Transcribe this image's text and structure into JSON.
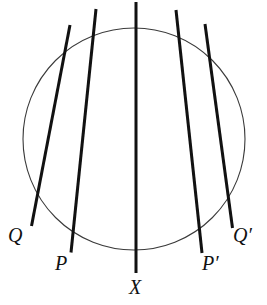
{
  "figure": {
    "kind": "geometry-diagram",
    "background_color": "#ffffff",
    "circle": {
      "name": "circle-outline",
      "center_x": 134,
      "center_y": 139,
      "radius": 111,
      "stroke_color": "#3a3a3a",
      "stroke_width": 1.1,
      "fill": "none"
    },
    "concurrency_point": {
      "name": "concurrency-point",
      "x": 135.5,
      "y": 105.5,
      "visible_marker": false
    },
    "line_style": {
      "stroke_color": "#111111",
      "stroke_width": 3.0,
      "linecap": "butt"
    },
    "lines": [
      {
        "id": "line-q",
        "label": "Q",
        "x1": 70.0,
        "y1": 25.0,
        "x2": 31.5,
        "y2": 226.0
      },
      {
        "id": "line-p",
        "label": "P",
        "x1": 96.0,
        "y1": 9.0,
        "x2": 71.0,
        "y2": 252.5
      },
      {
        "id": "line-x-vertical",
        "label": "X",
        "x1": 136.0,
        "y1": 2.0,
        "x2": 136.0,
        "y2": 273.0
      },
      {
        "id": "line-p-prime",
        "label": "P′",
        "x1": 176.0,
        "y1": 10.0,
        "x2": 202.0,
        "y2": 253.0
      },
      {
        "id": "line-q-prime",
        "label": "Q′",
        "x1": 205.0,
        "y1": 24.0,
        "x2": 232.5,
        "y2": 228.0
      }
    ],
    "labels": [
      {
        "id": "label-q",
        "text": "Q",
        "x": 8,
        "y": 225,
        "font_size": 20,
        "italic": true
      },
      {
        "id": "label-p",
        "text": "P",
        "x": 55,
        "y": 253,
        "font_size": 20,
        "italic": true
      },
      {
        "id": "label-x",
        "text": "X",
        "x": 129,
        "y": 277,
        "font_size": 20,
        "italic": true
      },
      {
        "id": "label-p-prime",
        "text": "P′",
        "x": 202,
        "y": 253,
        "font_size": 20,
        "italic": true
      },
      {
        "id": "label-q-prime",
        "text": "Q′",
        "x": 233,
        "y": 225,
        "font_size": 20,
        "italic": true
      }
    ]
  }
}
